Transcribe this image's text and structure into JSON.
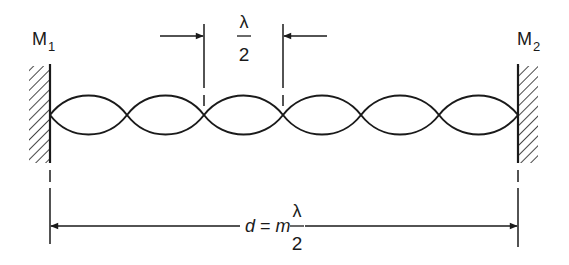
{
  "diagram": {
    "mirrors": [
      {
        "label_main": "M",
        "label_sub": "1",
        "side": "left"
      },
      {
        "label_main": "M",
        "label_sub": "2",
        "side": "right"
      }
    ],
    "wave": {
      "loops": 6,
      "nodes_count": 7
    },
    "half_wavelength_marker": {
      "numerator": "λ",
      "denominator": "2"
    },
    "cavity_length_label": {
      "lhs": "d",
      "equals": "=",
      "coef": "m",
      "numerator": "λ",
      "denominator": "2"
    },
    "colors": {
      "ink": "#1a1a1a",
      "background": "#ffffff"
    }
  }
}
